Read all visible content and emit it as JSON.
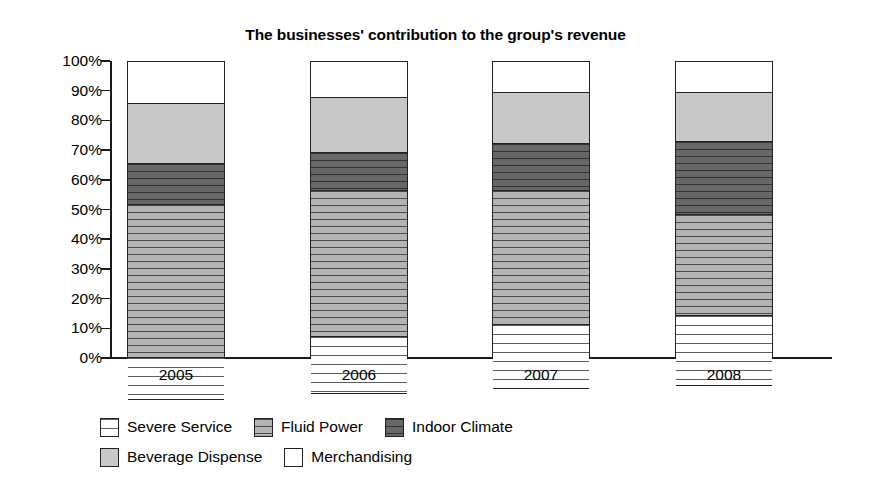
{
  "chart_data": {
    "type": "bar",
    "subtype": "stacked-bar-100-percent",
    "title": "The businesses' contribution to the group's revenue",
    "xlabel": "",
    "ylabel": "",
    "categories": [
      "2005",
      "2006",
      "2007",
      "2008"
    ],
    "ylim": [
      0,
      100
    ],
    "ytick_labels": [
      "0%",
      "10%",
      "20%",
      "30%",
      "40%",
      "50%",
      "60%",
      "70%",
      "80%",
      "90%",
      "100%"
    ],
    "ytick_values": [
      0,
      10,
      20,
      30,
      40,
      50,
      60,
      70,
      80,
      90,
      100
    ],
    "grid": false,
    "legend_position": "bottom",
    "stack_order_bottom_to_top": [
      "Severe Service",
      "Fluid Power",
      "Indoor Climate",
      "Beverage Dispense",
      "Merchandising"
    ],
    "series": [
      {
        "name": "Severe Service",
        "fill": "white-horizontal-lines",
        "color": "#ffffff",
        "values": [
          14.5,
          19.5,
          22.0,
          24.0
        ]
      },
      {
        "name": "Fluid Power",
        "fill": "gray-horizontal-hatch",
        "color": "#b4b4b4",
        "values": [
          51.5,
          49.0,
          45.0,
          34.0
        ]
      },
      {
        "name": "Indoor Climate",
        "fill": "dark-gray-horizontal-hatch",
        "color": "#5a5a5a",
        "values": [
          13.5,
          13.0,
          16.0,
          24.5
        ]
      },
      {
        "name": "Beverage Dispense",
        "fill": "light-gray-solid",
        "color": "#c8c8c8",
        "values": [
          20.5,
          18.5,
          17.0,
          16.5
        ]
      },
      {
        "name": "Merchandising",
        "fill": "white-solid",
        "color": "#ffffff",
        "values": [
          14.0,
          12.0,
          10.5,
          10.5
        ]
      }
    ],
    "cumulative_tops": [
      [
        14.5,
        66.0,
        79.5,
        100.0
      ],
      [
        19.5,
        68.5,
        81.5,
        100.0
      ],
      [
        22.0,
        67.0,
        83.0,
        100.0
      ],
      [
        24.0,
        58.0,
        73.0,
        100.0
      ]
    ],
    "legend": [
      {
        "label": "Severe Service",
        "swatch": "severe"
      },
      {
        "label": "Fluid Power",
        "swatch": "fluid"
      },
      {
        "label": "Indoor Climate",
        "swatch": "indoor"
      },
      {
        "label": "Beverage Dispense",
        "swatch": "beverage"
      },
      {
        "label": "Merchandising",
        "swatch": "merch"
      }
    ]
  }
}
